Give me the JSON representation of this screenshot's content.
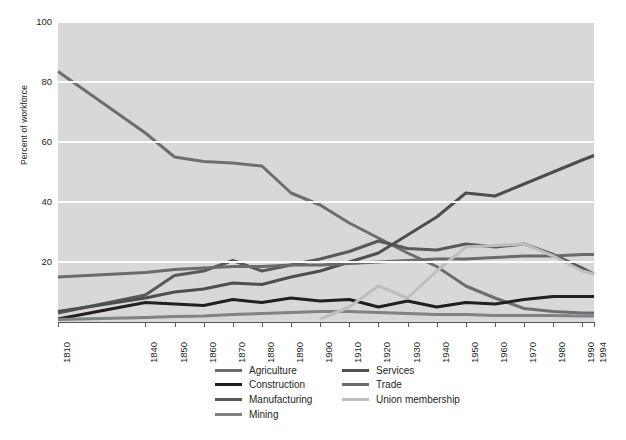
{
  "chart_data": {
    "type": "line",
    "title": "",
    "xlabel": "",
    "ylabel": "Percent of workforce",
    "xlim": [
      1810,
      1994
    ],
    "ylim": [
      0,
      100
    ],
    "grid": true,
    "legend_position": "bottom",
    "y_ticks": [
      20,
      40,
      60,
      80,
      100
    ],
    "x_ticks": [
      1810,
      1840,
      1850,
      1860,
      1870,
      1880,
      1890,
      1900,
      1910,
      1920,
      1930,
      1940,
      1950,
      1960,
      1970,
      1980,
      1990,
      1994
    ],
    "x_tick_labels": [
      "1810",
      "1840",
      "1850",
      "1860",
      "1870",
      "1880",
      "1890",
      "1900",
      "1910",
      "1920",
      "1930",
      "1940",
      "1950",
      "1960",
      "1970",
      "1980",
      "1990",
      "1994"
    ],
    "series": [
      {
        "name": "Agriculture",
        "color": "#6d6e71",
        "x": [
          1810,
          1840,
          1850,
          1860,
          1870,
          1880,
          1890,
          1900,
          1910,
          1920,
          1930,
          1940,
          1950,
          1960,
          1970,
          1980,
          1990,
          1994
        ],
        "values": [
          83.5,
          63.0,
          55.0,
          53.5,
          53.0,
          52.0,
          43.0,
          39.0,
          33.0,
          28.0,
          23.0,
          18.5,
          12.0,
          8.0,
          4.5,
          3.5,
          3.0,
          3.0
        ]
      },
      {
        "name": "Construction",
        "color": "#231f20",
        "x": [
          1810,
          1840,
          1850,
          1860,
          1870,
          1880,
          1890,
          1900,
          1910,
          1920,
          1930,
          1940,
          1950,
          1960,
          1970,
          1980,
          1990,
          1994
        ],
        "values": [
          1.0,
          6.5,
          6.0,
          5.5,
          7.5,
          6.5,
          8.0,
          7.0,
          7.5,
          5.0,
          7.0,
          5.0,
          6.5,
          6.0,
          7.5,
          8.5,
          8.5,
          8.5
        ]
      },
      {
        "name": "Manufacturing",
        "color": "#58595b",
        "x": [
          1810,
          1840,
          1850,
          1860,
          1870,
          1880,
          1890,
          1900,
          1910,
          1920,
          1930,
          1940,
          1950,
          1960,
          1970,
          1980,
          1990,
          1994
        ],
        "values": [
          3.0,
          9.0,
          15.5,
          17.0,
          20.5,
          17.0,
          19.0,
          21.0,
          23.5,
          27.0,
          24.5,
          24.0,
          26.0,
          25.0,
          26.0,
          22.5,
          18.0,
          16.0
        ]
      },
      {
        "name": "Mining",
        "color": "#808285",
        "x": [
          1810,
          1840,
          1850,
          1860,
          1870,
          1880,
          1890,
          1900,
          1910,
          1920,
          1930,
          1940,
          1950,
          1960,
          1970,
          1980,
          1990,
          1994
        ],
        "values": [
          0.8,
          1.5,
          1.8,
          2.0,
          2.5,
          2.8,
          3.2,
          3.5,
          3.5,
          3.2,
          2.8,
          2.5,
          2.5,
          2.2,
          2.2,
          2.2,
          2.0,
          2.0
        ]
      },
      {
        "name": "Services",
        "color": "#4d4e50",
        "x": [
          1810,
          1840,
          1850,
          1860,
          1870,
          1880,
          1890,
          1900,
          1910,
          1920,
          1930,
          1940,
          1950,
          1960,
          1970,
          1980,
          1990,
          1994
        ],
        "values": [
          3.5,
          8.0,
          10.0,
          11.0,
          13.0,
          12.5,
          15.0,
          17.0,
          20.0,
          23.0,
          29.0,
          35.0,
          43.0,
          42.0,
          46.0,
          50.0,
          54.0,
          55.5
        ]
      },
      {
        "name": "Trade",
        "color": "#6a6b6d",
        "x": [
          1810,
          1840,
          1850,
          1860,
          1870,
          1880,
          1890,
          1900,
          1910,
          1920,
          1930,
          1940,
          1950,
          1960,
          1970,
          1980,
          1990,
          1994
        ],
        "values": [
          15.0,
          16.5,
          17.5,
          18.0,
          18.5,
          18.5,
          19.0,
          19.0,
          19.5,
          20.0,
          20.5,
          21.0,
          21.0,
          21.5,
          22.0,
          22.0,
          22.5,
          22.5
        ]
      },
      {
        "name": "Union membership",
        "color": "#bcbec0",
        "x": [
          1900,
          1910,
          1920,
          1930,
          1940,
          1950,
          1960,
          1970,
          1980,
          1990,
          1994
        ],
        "values": [
          1.0,
          5.0,
          12.0,
          8.0,
          17.0,
          25.0,
          25.5,
          26.0,
          22.0,
          17.0,
          16.0
        ]
      }
    ]
  },
  "axes": {
    "y_title": "Percent of workforce",
    "y_tick_labels": [
      "100",
      "80",
      "60",
      "40",
      "20"
    ],
    "x_tick_labels": [
      "1810",
      "1840",
      "1850",
      "1860",
      "1870",
      "1880",
      "1890",
      "1900",
      "1910",
      "1920",
      "1930",
      "1940",
      "1950",
      "1960",
      "1970",
      "1980",
      "1990",
      "1994"
    ]
  },
  "legend": {
    "column_1": [
      {
        "label": "Agriculture",
        "color": "#6d6e71"
      },
      {
        "label": "Construction",
        "color": "#231f20"
      },
      {
        "label": "Manufacturing",
        "color": "#58595b"
      },
      {
        "label": "Mining",
        "color": "#808285"
      }
    ],
    "column_2": [
      {
        "label": "Services",
        "color": "#4d4e50"
      },
      {
        "label": "Trade",
        "color": "#6a6b6d"
      },
      {
        "label": "Union membership",
        "color": "#bcbec0"
      }
    ]
  },
  "style": {
    "plot_background": "#d8d8d8",
    "gridline_color": "#fbfbfb",
    "page_background": "#ffffff",
    "axis_color": "#58595b"
  }
}
